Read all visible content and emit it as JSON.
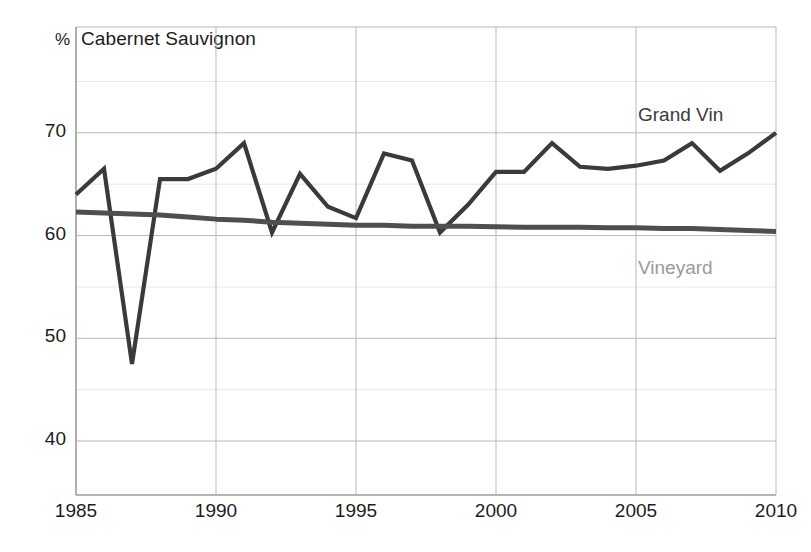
{
  "chart_data": {
    "type": "line",
    "title": "Cabernet Sauvignon",
    "unit_symbol": "%",
    "xlabel": "",
    "ylabel": "",
    "xlim": [
      1985,
      2010
    ],
    "ylim": [
      34.75,
      80.3
    ],
    "grid": true,
    "grid_major_y": [
      40,
      50,
      60,
      70
    ],
    "grid_minor_y": [
      45,
      55,
      65,
      75
    ],
    "grid_major_x": [
      1985,
      1990,
      1995,
      2000,
      2005,
      2010
    ],
    "xticks": [
      "1985",
      "1990",
      "1995",
      "2000",
      "2005",
      "2010"
    ],
    "yticks": [
      "40",
      "50",
      "60",
      "70"
    ],
    "legend_position": "inline-right",
    "x": [
      1985,
      1986,
      1987,
      1988,
      1989,
      1990,
      1991,
      1992,
      1993,
      1994,
      1995,
      1996,
      1997,
      1998,
      1999,
      2000,
      2001,
      2002,
      2003,
      2004,
      2005,
      2006,
      2007,
      2008,
      2009,
      2010
    ],
    "series": [
      {
        "name": "Grand Vin",
        "color": "#3a3a3a",
        "values": [
          64.0,
          66.5,
          47.5,
          65.5,
          65.5,
          66.5,
          69.0,
          60.3,
          66.0,
          62.8,
          61.7,
          68.0,
          67.3,
          60.3,
          63.0,
          66.2,
          66.2,
          69.0,
          66.7,
          66.5,
          66.8,
          67.3,
          69.0,
          66.3,
          68.0,
          70.0
        ]
      },
      {
        "name": "Vineyard",
        "color": "#4f4f4f",
        "values": [
          62.3,
          62.2,
          62.1,
          62.0,
          61.8,
          61.6,
          61.5,
          61.3,
          61.2,
          61.1,
          61.0,
          61.0,
          60.9,
          60.9,
          60.9,
          60.85,
          60.8,
          60.8,
          60.8,
          60.75,
          60.75,
          60.7,
          60.7,
          60.6,
          60.5,
          60.4
        ]
      }
    ]
  },
  "colors": {
    "grand_vin": "#3a3a3a",
    "vineyard": "#4f4f4f",
    "vineyard_label": "#9a9a9a",
    "grid_major": "#b9b9b9",
    "grid_minor": "#e6e6e6",
    "axis": "#9c9c9c",
    "text": "#1c1c1c",
    "background": "#ffffff"
  }
}
